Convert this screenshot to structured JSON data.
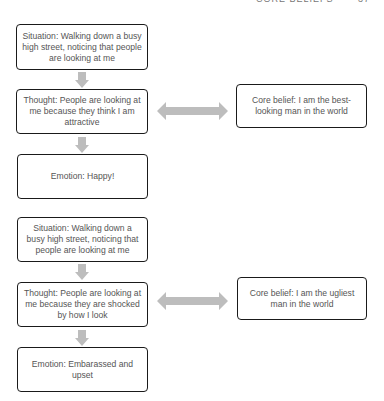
{
  "running_head": {
    "title": "CORE BELIEFS",
    "page_number": "37"
  },
  "diagrams": [
    {
      "situation": "Situation: Walking down a busy high street, noticing that people are looking at me",
      "thought": "Thought: People are looking at me because they think I am attractive",
      "core_belief": "Core belief: I am the best-looking man in the world",
      "emotion": "Emotion: Happy!"
    },
    {
      "situation": "Situation: Walking down a busy high street, noticing that people are looking at me",
      "thought": "Thought: People are looking at me because they are shocked by how I look",
      "core_belief": "Core belief: I am the ugliest man in the world",
      "emotion": "Emotion: Embarassed and upset"
    }
  ],
  "colors": {
    "box_border": "#1a1a1a",
    "text": "#555555",
    "arrow_fill": "#bdbdbd"
  },
  "icons": {
    "down_arrow": "down-block-arrow",
    "double_arrow": "left-right-block-arrow"
  }
}
